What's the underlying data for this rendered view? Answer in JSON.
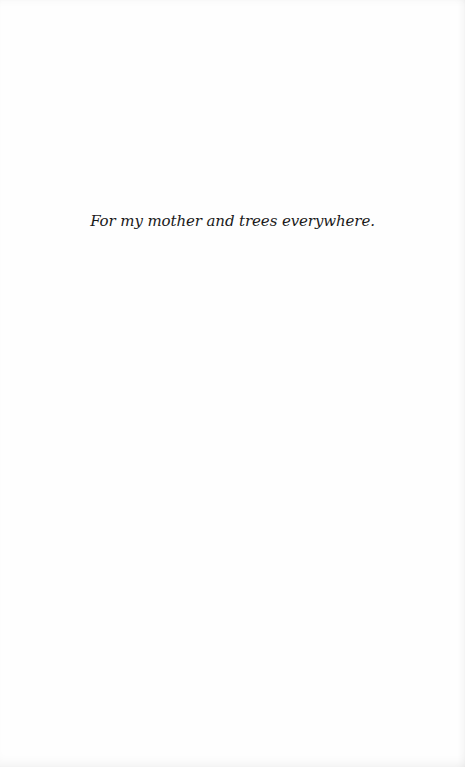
{
  "page": {
    "dedication": "For my mother and trees everywhere."
  }
}
